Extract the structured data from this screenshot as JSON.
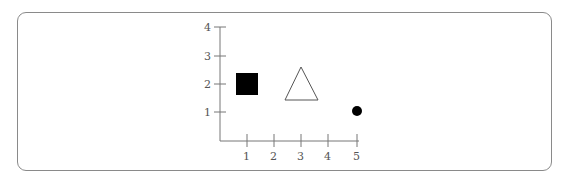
{
  "figure": {
    "x_axis": {
      "ticks": [
        "1",
        "2",
        "3",
        "4",
        "5"
      ]
    },
    "y_axis": {
      "ticks": [
        "1",
        "2",
        "3",
        "4"
      ]
    },
    "shapes": [
      {
        "name": "filled-square",
        "x": 1,
        "y": 2,
        "fill": "#000000"
      },
      {
        "name": "hollow-triangle",
        "x": 3,
        "y": 2,
        "fill": "none",
        "stroke": "#555555"
      },
      {
        "name": "filled-circle",
        "x": 5,
        "y": 1,
        "fill": "#000000"
      }
    ]
  },
  "colors": {
    "axis": "#777777",
    "frame": "#8a8a8a",
    "label": "#555555"
  }
}
